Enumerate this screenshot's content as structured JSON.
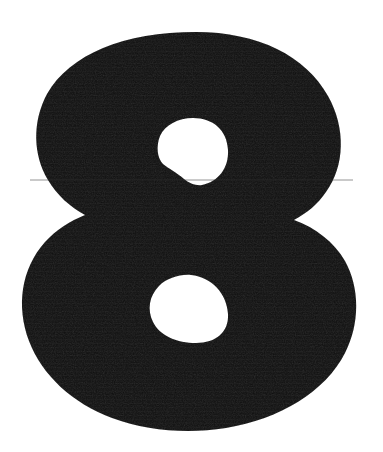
{
  "image": {
    "type": "scanned-numeral",
    "subject": "8",
    "character": "8",
    "description": "Large bold black numeral eight on a plain white background",
    "width": 383,
    "height": 452,
    "orientation": "portrait"
  },
  "colors": {
    "background": "#ffffff",
    "glyph_fill": "#0d0d0d",
    "glyph_fill_light": "#1a1a1a",
    "counter_fill": "#ffffff"
  },
  "glyph": {
    "label": "8",
    "bbox": {
      "x": 22,
      "y": 32,
      "width": 334,
      "height": 399
    },
    "upper_bowl": {
      "left": 42,
      "right": 342,
      "top": 32,
      "bottom": 230
    },
    "lower_bowl": {
      "left": 22,
      "right": 356,
      "top": 222,
      "bottom": 431
    },
    "waist": {
      "y": 226,
      "left_notch_x": 72,
      "right_notch_x": 315
    },
    "upper_counter": {
      "left": 158,
      "right": 228,
      "top": 118,
      "bottom": 185
    },
    "lower_counter": {
      "left": 150,
      "right": 228,
      "top": 275,
      "bottom": 343
    },
    "outline_path": "M 196 32 C 258 32 306 56 328 96 C 346 128 345 166 326 192 C 318 204 307 213 294 220 C 316 228 334 242 345 261 C 360 288 360 324 345 353 C 325 392 280 419 226 428 C 188 434 147 431 112 418 C 72 403 42 375 29 341 C 16 306 21 269 45 242 C 56 230 70 221 85 215 C 70 207 57 195 48 180 C 33 155 32 122 47 94 C 70 54 124 32 196 32 Z",
    "upper_counter_path": "M 193 118 C 213 118 227 130 228 150 C 229 168 218 182 202 185 C 196 186 189 183 184 179 C 176 172 169 169 163 164 C 157 158 156 146 160 136 C 165 125 178 118 193 118 Z",
    "lower_counter_path": "M 191 275 C 212 277 227 294 228 314 C 229 332 216 343 196 343 C 177 343 160 336 153 322 C 147 310 149 296 159 286 C 167 278 180 274 191 275 Z"
  },
  "texture": {
    "grain": "fine-scan-noise",
    "scanlines": "faint-horizontal",
    "seam_line_y": 180
  },
  "alt_text": "8"
}
